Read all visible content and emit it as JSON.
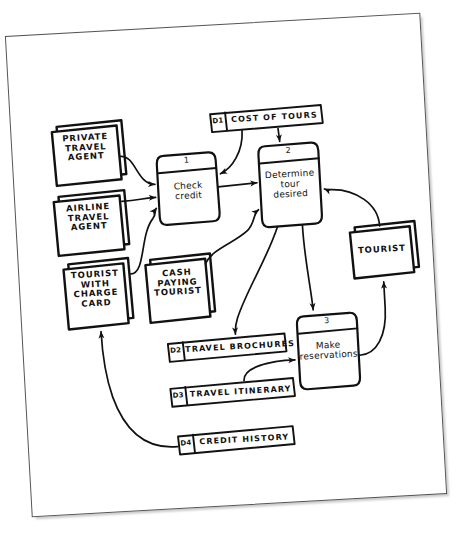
{
  "diagram": {
    "medium": "hand-drawn pencil sketch on white paper",
    "ink_color": "#111111",
    "paper_color": "#ffffff",
    "background_color": "#ffffff"
  },
  "external_entities": [
    {
      "id": "private-travel-agent",
      "label": "PRIVATE\nTRAVEL\nAGENT",
      "x": 60,
      "y": 120,
      "w": 66,
      "h": 52
    },
    {
      "id": "airline-travel-agent",
      "label": "AIRLINE\nTRAVEL\nAGENT",
      "x": 58,
      "y": 190,
      "w": 68,
      "h": 52
    },
    {
      "id": "tourist-with-charge-card",
      "label": "TOURIST\nWITH\nCHARGE\nCARD",
      "x": 64,
      "y": 258,
      "w": 62,
      "h": 58
    },
    {
      "id": "cash-paying-tourist",
      "label": "CASH\nPAYING\nTOURIST",
      "x": 146,
      "y": 258,
      "w": 62,
      "h": 54
    },
    {
      "id": "tourist",
      "label": "TOURIST",
      "x": 352,
      "y": 237,
      "w": 62,
      "h": 44
    }
  ],
  "processes": [
    {
      "id": "check-credit",
      "number": "1",
      "label": "Check\ncredit",
      "x": 164,
      "y": 152,
      "w": 58,
      "h": 68
    },
    {
      "id": "determine-tour",
      "number": "2",
      "label": "Determine\ntour\ndesired",
      "x": 266,
      "y": 148,
      "w": 58,
      "h": 80
    },
    {
      "id": "make-reservations",
      "number": "3",
      "label": "Make\nreservations",
      "x": 295,
      "y": 320,
      "w": 58,
      "h": 72
    }
  ],
  "data_stores": [
    {
      "id": "d1",
      "code": "D1",
      "name": "COST OF TOURS",
      "x": 218,
      "y": 113,
      "w": 110,
      "h": 17
    },
    {
      "id": "d2",
      "code": "D2",
      "name": "TRAVEL BROCHURES",
      "x": 163,
      "y": 340,
      "w": 116,
      "h": 17
    },
    {
      "id": "d3",
      "code": "D3",
      "name": "TRAVEL ITINERARY",
      "x": 163,
      "y": 385,
      "w": 122,
      "h": 17
    },
    {
      "id": "d4",
      "code": "D4",
      "name": "CREDIT HISTORY",
      "x": 168,
      "y": 433,
      "w": 114,
      "h": 17
    }
  ],
  "data_flows": [
    {
      "id": "flow-private-agent-to-check-credit",
      "from": "private-travel-agent",
      "to": "check-credit"
    },
    {
      "id": "flow-airline-agent-to-check-credit",
      "from": "airline-travel-agent",
      "to": "check-credit"
    },
    {
      "id": "flow-charge-card-tourist-to-check-credit",
      "from": "tourist-with-charge-card",
      "to": "check-credit"
    },
    {
      "id": "flow-cash-tourist-to-determine-tour",
      "from": "cash-paying-tourist",
      "to": "determine-tour"
    },
    {
      "id": "flow-check-credit-to-determine-tour",
      "from": "check-credit",
      "to": "determine-tour"
    },
    {
      "id": "flow-d1-to-check-credit",
      "from": "d1",
      "to": "check-credit"
    },
    {
      "id": "flow-d1-to-determine-tour",
      "from": "d1",
      "to": "determine-tour"
    },
    {
      "id": "flow-tourist-to-determine-tour",
      "from": "tourist",
      "to": "determine-tour"
    },
    {
      "id": "flow-determine-tour-to-d2",
      "from": "determine-tour",
      "to": "d2"
    },
    {
      "id": "flow-determine-tour-to-make-reservations",
      "from": "determine-tour",
      "to": "make-reservations"
    },
    {
      "id": "flow-d3-to-make-reservations",
      "from": "d3",
      "to": "make-reservations"
    },
    {
      "id": "flow-make-reservations-to-tourist",
      "from": "make-reservations",
      "to": "tourist"
    },
    {
      "id": "flow-d4-to-charge-card-tourist",
      "from": "d4",
      "to": "tourist-with-charge-card"
    }
  ]
}
